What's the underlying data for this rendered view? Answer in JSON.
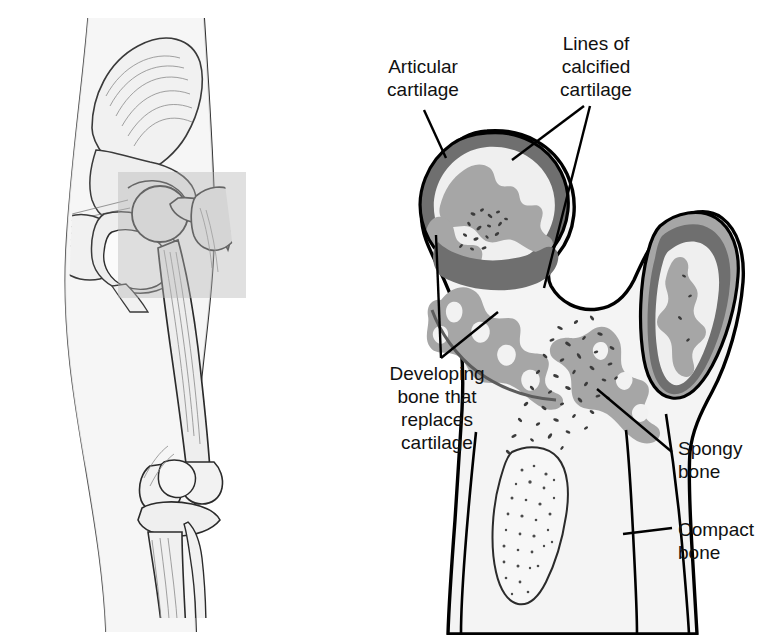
{
  "figure": {
    "kind": "anatomical-illustration",
    "panels": [
      {
        "id": "overview",
        "name": "Hip and leg skeleton overview, anterior view"
      },
      {
        "id": "detail",
        "name": "Cut-away detail of proximal femur and hip joint"
      }
    ]
  },
  "labels": [
    {
      "id": "articular",
      "text": "Articular\ncartilage"
    },
    {
      "id": "lines",
      "text": "Lines of\ncalcified\ncartilage"
    },
    {
      "id": "developing",
      "text": "Developing\nbone that\nreplaces\ncartilage"
    },
    {
      "id": "spongy",
      "text": "Spongy\nbone"
    },
    {
      "id": "compact",
      "text": "Compact\nbone"
    }
  ],
  "colors": {
    "ink": "#111111",
    "outline": "#000000",
    "cortex_dark_gray": "#6f6f6f",
    "calcified_gray": "#a6a6a6",
    "developing_light": "#efefef",
    "marrow_light": "#f2f2f2",
    "highlight_box": "#c9c9c9",
    "overview_fill": "#f0f0f0",
    "overview_line": "#6b6b6b",
    "page_bg": "#ffffff"
  },
  "overview": {
    "highlight_region_label": "Magnified region",
    "structures": [
      "ilium",
      "iliac crest",
      "acetabulum",
      "pubis",
      "ischium",
      "obturator foramen",
      "femoral head",
      "greater trochanter",
      "femur shaft",
      "patella",
      "femoral condyles",
      "tibia",
      "fibula"
    ]
  },
  "detail": {
    "structures": [
      "articular cartilage",
      "lines of calcified cartilage",
      "developing bone that replaces cartilage",
      "spongy bone",
      "compact bone",
      "epiphysis",
      "greater trochanter",
      "medullary cavity"
    ]
  }
}
